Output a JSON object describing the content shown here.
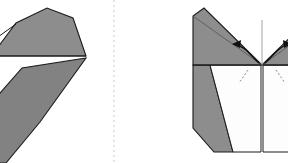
{
  "canvas": {
    "width": 288,
    "height": 163,
    "background": "#ffffff"
  },
  "divider": {
    "label": "panel divider",
    "orientation": "vertical",
    "x": 114,
    "y_start": 0,
    "y_end": 163,
    "style": "dashed",
    "color": "#c9c9c9"
  },
  "colors": {
    "paper_front": "#8d8d8d",
    "paper_front_alt": "#828282",
    "paper_back": "#fdfdfd",
    "outline": "#1b1b1b",
    "crease": "#5a5a5a",
    "crease_faint": "#9a9a9a",
    "dashed_fold": "#7a7a7a",
    "arrow": "#111111",
    "divider": "#c9c9c9",
    "background": "#ffffff"
  },
  "panels": [
    {
      "id": "left-panel",
      "label": "angled folded model",
      "description": "Rotated view of the folded paper form, cropped at the left edge of the frame",
      "shapes": [
        {
          "name": "upper-flap",
          "fill": "#8d8d8d",
          "points": "-20,36 -6,44 -2,47 16,23 47,8 73,18 86,56 -2,56 -14,50"
        },
        {
          "name": "lower-flap",
          "fill": "#828282",
          "points": "-24,163 -6,100 22,68 86,58 40,122 6,163"
        }
      ],
      "creases": [
        {
          "name": "upper-left-crease",
          "path": "-16,47 16,24"
        },
        {
          "name": "spine-crease",
          "path": "-2,56 86,56"
        }
      ]
    },
    {
      "id": "right-panel",
      "label": "front view with outward fold arrows",
      "description": "Symmetric front view: gray top band with converging diagonal valley folds, white triangular under-flaps, gray side panels, vertical centre crease and two outward curved arrows",
      "shapes": [
        {
          "name": "top-band-left",
          "fill": "#8d8d8d",
          "points": "193,16 193,65 262,65 204,8"
        },
        {
          "name": "top-band-right",
          "fill": "#8d8d8d",
          "points": "262,65 320,8 331,16 331,65"
        },
        {
          "name": "side-panel-left",
          "fill": "#8d8d8d",
          "points": "193,65 193,128 214,152 233,152 210,65"
        },
        {
          "name": "side-panel-right",
          "fill": "#8d8d8d",
          "points": "331,65 331,128 310,152 291,152 314,65"
        },
        {
          "name": "under-flap-left",
          "fill": "#fdfdfd",
          "points": "210,65 261,65 261,152 233,152"
        },
        {
          "name": "under-flap-right",
          "fill": "#fdfdfd",
          "points": "263,65 314,65 291,152 263,152"
        }
      ],
      "creases": [
        {
          "name": "horizontal-band-crease",
          "path": "193,65 331,65"
        },
        {
          "name": "centre-vertical-crease",
          "path": "262,20 262,152"
        },
        {
          "name": "diagonal-fold-left",
          "path": "193,16 262,65"
        },
        {
          "name": "diagonal-fold-right",
          "path": "331,16 262,65"
        }
      ],
      "dashed_folds": [
        {
          "name": "dashed-fold-left",
          "path": "248,70 239,83"
        },
        {
          "name": "dashed-fold-right",
          "path": "276,70 285,83"
        }
      ],
      "arrows": [
        {
          "name": "fold-arrow-left",
          "direction": "outward-left",
          "description": "curved arrow sweeping from the centre point out to the left"
        },
        {
          "name": "fold-arrow-right",
          "direction": "outward-right",
          "description": "curved arrow sweeping from the centre point out to the right"
        }
      ]
    }
  ]
}
